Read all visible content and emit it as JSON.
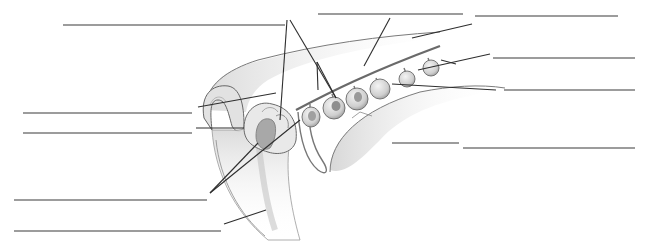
{
  "diagram": {
    "style": "grayscale pencil illustration",
    "colors": {
      "background": "#ffffff",
      "label_line": "#3a3a3a",
      "tissue_outline": "#555555",
      "tissue_fill_light": "#e6e6e6",
      "tissue_fill_mid": "#c8c8c8",
      "tissue_fill_dark": "#9a9a9a"
    },
    "label_blanks": [
      {
        "id": 1,
        "text": "",
        "line": [
          63,
          25,
          285,
          25
        ]
      },
      {
        "id": 2,
        "text": "",
        "line": [
          318,
          14,
          463,
          14
        ]
      },
      {
        "id": 3,
        "text": "",
        "line": [
          475,
          16,
          618,
          16
        ]
      },
      {
        "id": 4,
        "text": "",
        "line": [
          493,
          58,
          635,
          58
        ]
      },
      {
        "id": 5,
        "text": "",
        "line": [
          504,
          90,
          635,
          90
        ]
      },
      {
        "id": 6,
        "text": "",
        "line": [
          23,
          113,
          192,
          113
        ]
      },
      {
        "id": 7,
        "text": "",
        "line": [
          23,
          133,
          192,
          133
        ]
      },
      {
        "id": 8,
        "text": "",
        "line": [
          392,
          143,
          459,
          143
        ]
      },
      {
        "id": 9,
        "text": "",
        "line": [
          463,
          148,
          635,
          148
        ]
      },
      {
        "id": 10,
        "text": "",
        "line": [
          14,
          200,
          207,
          200
        ]
      },
      {
        "id": 11,
        "text": "",
        "line": [
          14,
          231,
          221,
          231
        ]
      }
    ],
    "leader_lines": [
      [
        285,
        20,
        298,
        22
      ],
      [
        288,
        22,
        280,
        120
      ],
      [
        290,
        22,
        318,
        88
      ],
      [
        316,
        60,
        318,
        88
      ],
      [
        390,
        18,
        363,
        68
      ],
      [
        412,
        38,
        472,
        24
      ],
      [
        418,
        68,
        488,
        52
      ],
      [
        441,
        56,
        455,
        62
      ],
      [
        392,
        84,
        496,
        90
      ],
      [
        198,
        107,
        276,
        93
      ],
      [
        196,
        128,
        245,
        128
      ],
      [
        210,
        193,
        258,
        143
      ],
      [
        210,
        193,
        300,
        118
      ],
      [
        224,
        224,
        266,
        210
      ]
    ]
  }
}
